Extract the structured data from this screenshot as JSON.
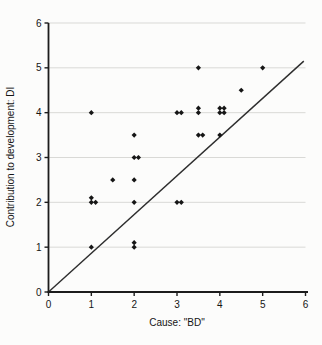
{
  "chart_data": {
    "type": "scatter",
    "title": "",
    "xlabel": "Cause: \"BD\"",
    "ylabel": "Contribution to development: DI",
    "xlim": [
      0,
      6
    ],
    "ylim": [
      0,
      6
    ],
    "xticks": [
      0,
      1,
      2,
      3,
      4,
      5,
      6
    ],
    "yticks": [
      0,
      1,
      2,
      3,
      4,
      5,
      6
    ],
    "grid": "horizontal-only",
    "legend": "none",
    "marker": "diamond",
    "points": [
      [
        1,
        4
      ],
      [
        3,
        4
      ],
      [
        3.1,
        4
      ],
      [
        3.5,
        4
      ],
      [
        3.5,
        4.1
      ],
      [
        4,
        4
      ],
      [
        4.1,
        4
      ],
      [
        4,
        4.1
      ],
      [
        4.1,
        4.1
      ],
      [
        3.5,
        5
      ],
      [
        5,
        5
      ],
      [
        4.5,
        4.5
      ],
      [
        2,
        3.5
      ],
      [
        3.5,
        3.5
      ],
      [
        3.6,
        3.5
      ],
      [
        4,
        3.5
      ],
      [
        2,
        3
      ],
      [
        2.1,
        3
      ],
      [
        1.5,
        2.5
      ],
      [
        2,
        2.5
      ],
      [
        1,
        2.1
      ],
      [
        1,
        2
      ],
      [
        1.1,
        2
      ],
      [
        2,
        2
      ],
      [
        3,
        2
      ],
      [
        3.1,
        2
      ],
      [
        1,
        1
      ],
      [
        2,
        1
      ],
      [
        2,
        1.1
      ]
    ],
    "reference_line": {
      "x1": 0,
      "y1": 0,
      "x2": 5.96,
      "y2": 5.15
    },
    "colors": {
      "marker": "#161616",
      "axis": "#1c1c1c",
      "grid": "#d9d9d6",
      "line": "#2e2e2e",
      "background": "#fcfcfb",
      "text": "#151515"
    }
  }
}
